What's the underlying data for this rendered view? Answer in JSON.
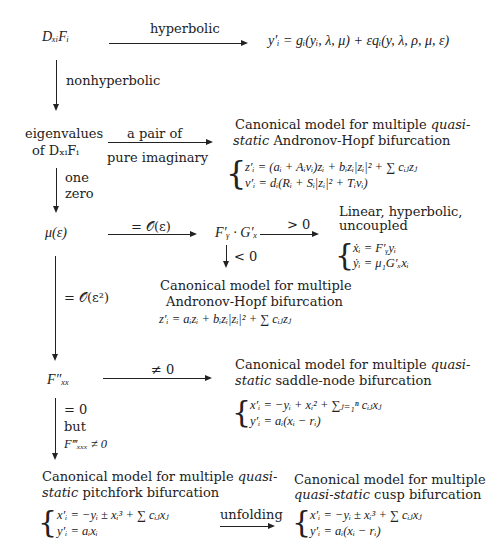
{
  "nodes": {
    "dxf": "DₓᵢFᵢ",
    "hyperbolic_result": "y′ᵢ = gᵢ(yᵢ, λ, μ) + εqᵢ(y, λ, ρ, μ, ε)",
    "eigen_line1": "eigenvalues",
    "eigen_line2": "of DₓᵢFᵢ",
    "mu_eps": "μ(ε)",
    "fg": "F′ᵧ · G′ₓ",
    "fxx": "F″ₓₓ"
  },
  "edges": {
    "hyperbolic": "hyperbolic",
    "nonhyperbolic": "nonhyperbolic",
    "pair_line1": "a pair of",
    "pair_line2": "pure imaginary",
    "one": "one",
    "zero": "zero",
    "o_eps": "= 𝒪(ε)",
    "gt0": "> 0",
    "lt0": "< 0",
    "o_eps2": "= 𝒪(ε²)",
    "neq0": "≠ 0",
    "eq0": "= 0",
    "but": "but",
    "fxxx": "F‴ₓₓₓ ≠ 0",
    "unfolding": "unfolding"
  },
  "boxes": {
    "qs_hopf": {
      "title1_pre": "Canonical model for multiple ",
      "title1_it": "quasi-",
      "title2_it": "static",
      "title2_post": " Andronov-Hopf bifurcation",
      "eq1": "z′ᵢ = (aᵢ + Aᵢvᵢ)zᵢ + bᵢzᵢ|zᵢ|² + ∑ cᵢⱼzⱼ",
      "eq2": "v′ᵢ = dᵢ(Rᵢ + Sᵢ|zᵢ|² + Tᵢvᵢ)"
    },
    "linear": {
      "title1": "Linear, hyperbolic,",
      "title2": "uncoupled",
      "eq1": "ẋᵢ = F′ᵧyᵢ",
      "eq2": "ẏᵢ = μ₁G′ₓxᵢ"
    },
    "hopf": {
      "title1": "Canonical model for multiple",
      "title2": "Andronov-Hopf bifurcation",
      "eq1": "z′ᵢ = aᵢzᵢ + bᵢzᵢ|zᵢ|² + ∑ cᵢⱼzⱼ"
    },
    "saddle": {
      "title1_pre": "Canonical model for multiple ",
      "title1_it": "quasi-",
      "title2_it": "static",
      "title2_post": " saddle-node bifurcation",
      "eq1": "x′ᵢ = −yᵢ + xᵢ² + ∑ⱼ₌₁ⁿ cᵢⱼxⱼ",
      "eq2": "y′ᵢ = aᵢ(xᵢ − rᵢ)"
    },
    "pitchfork": {
      "title1_pre": "Canonical model for multiple ",
      "title1_it": "quasi-",
      "title2_it": "static",
      "title2_post": " pitchfork bifurcation",
      "eq1": "x′ᵢ = −yᵢ ± xᵢ³ + ∑ cᵢⱼxⱼ",
      "eq2": "y′ᵢ = aᵢxᵢ"
    },
    "cusp": {
      "title1": "Canonical model for multiple",
      "title2_it": "quasi-static",
      "title2_post": " cusp bifurcation",
      "eq1": "x′ᵢ = −yᵢ ± xᵢ³ + ∑ cᵢⱼxⱼ",
      "eq2": "y′ᵢ = aᵢ(xᵢ − rᵢ)"
    }
  }
}
